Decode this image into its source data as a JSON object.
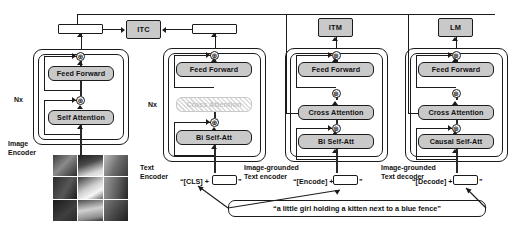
{
  "figure": {
    "kind": "model-architecture-diagram",
    "name": "BLIP pre-training model architecture and objectives"
  },
  "objectives": [
    {
      "id": "itc",
      "label": "ITC"
    },
    {
      "id": "itm",
      "label": "ITM"
    },
    {
      "id": "lm",
      "label": "LM"
    }
  ],
  "columns": {
    "image_encoder": {
      "caption": "Image\nEncoder",
      "repeat": "Nx",
      "modules": [
        {
          "label": "Feed Forward",
          "state": "active"
        },
        {
          "label": "Self Attention",
          "state": "active"
        }
      ]
    },
    "text_encoder": {
      "caption": "Text\nEncoder",
      "repeat": "Nx",
      "prompt_token": "“[CLS] +",
      "prompt_suffix": "”",
      "modules": [
        {
          "label": "Feed Forward",
          "state": "active"
        },
        {
          "label": "Cross Attention",
          "state": "disabled"
        },
        {
          "label": "Bi Self-Att",
          "state": "active"
        }
      ]
    },
    "grounded_text_encoder": {
      "caption": "Image-grounded\nText encoder",
      "prompt_token": "“[Encode] +",
      "prompt_suffix": "”",
      "modules": [
        {
          "label": "Feed Forward",
          "state": "active"
        },
        {
          "label": "Cross Attention",
          "state": "active"
        },
        {
          "label": "Bi Self-Att",
          "state": "active"
        }
      ]
    },
    "grounded_text_decoder": {
      "caption": "Image-grounded\nText decoder",
      "prompt_token": "“[Decode] +",
      "prompt_suffix": "”",
      "modules": [
        {
          "label": "Feed Forward",
          "state": "active"
        },
        {
          "label": "Cross Attention",
          "state": "active"
        },
        {
          "label": "Causal Self-Att",
          "state": "active"
        }
      ]
    }
  },
  "caption_text": "“a little girl holding a kitten next to a blue fence”",
  "input_image": {
    "alt": "grayscale photo of a little girl holding a kitten, split into a 3x3 patch grid",
    "patch_rows": 3,
    "patch_cols": 3
  },
  "symbols": {
    "residual_add": "⊕"
  },
  "colors": {
    "module_fill": "#c9c9c9",
    "disabled_fill": "#f2f2f2",
    "stroke": "#1b1b1b",
    "background": "#ffffff"
  }
}
